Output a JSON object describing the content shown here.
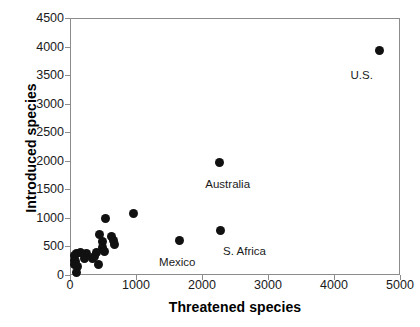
{
  "chart_data": {
    "type": "scatter",
    "title": "",
    "xlabel": "Threatened species",
    "ylabel": "Introduced species",
    "xlim": [
      0,
      5000
    ],
    "ylim": [
      0,
      4500
    ],
    "xticks": [
      0,
      1000,
      2000,
      3000,
      4000,
      5000
    ],
    "yticks": [
      0,
      500,
      1000,
      1500,
      2000,
      2500,
      3000,
      3500,
      4000,
      4500
    ],
    "grid": false,
    "legend": false,
    "marker_color": "#111111",
    "axis_color": "#8c8c8c",
    "points": [
      {
        "x": 4680,
        "y": 3950,
        "label": "U.S."
      },
      {
        "x": 2250,
        "y": 1990,
        "label": "Australia"
      },
      {
        "x": 2270,
        "y": 800,
        "label": "S. Africa"
      },
      {
        "x": 1650,
        "y": 620,
        "label": "Mexico"
      },
      {
        "x": 940,
        "y": 1100,
        "label": ""
      },
      {
        "x": 520,
        "y": 1000,
        "label": ""
      },
      {
        "x": 620,
        "y": 700,
        "label": ""
      },
      {
        "x": 640,
        "y": 620,
        "label": ""
      },
      {
        "x": 660,
        "y": 560,
        "label": ""
      },
      {
        "x": 430,
        "y": 720,
        "label": ""
      },
      {
        "x": 470,
        "y": 600,
        "label": ""
      },
      {
        "x": 480,
        "y": 500,
        "label": ""
      },
      {
        "x": 500,
        "y": 430,
        "label": ""
      },
      {
        "x": 390,
        "y": 420,
        "label": ""
      },
      {
        "x": 360,
        "y": 350,
        "label": ""
      },
      {
        "x": 330,
        "y": 300,
        "label": ""
      },
      {
        "x": 420,
        "y": 210,
        "label": ""
      },
      {
        "x": 240,
        "y": 390,
        "label": ""
      },
      {
        "x": 200,
        "y": 300,
        "label": ""
      },
      {
        "x": 140,
        "y": 420,
        "label": ""
      },
      {
        "x": 90,
        "y": 400,
        "label": ""
      },
      {
        "x": 60,
        "y": 360,
        "label": ""
      },
      {
        "x": 55,
        "y": 280,
        "label": ""
      },
      {
        "x": 70,
        "y": 250,
        "label": ""
      },
      {
        "x": 50,
        "y": 200,
        "label": ""
      },
      {
        "x": 95,
        "y": 160,
        "label": ""
      },
      {
        "x": 85,
        "y": 60,
        "label": ""
      }
    ],
    "annotations": [
      {
        "text": "U.S.",
        "x": 4250,
        "y": 3600
      },
      {
        "text": "Australia",
        "x": 2050,
        "y": 1690
      },
      {
        "text": "S. Africa",
        "x": 2320,
        "y": 520
      },
      {
        "text": "Mexico",
        "x": 1350,
        "y": 330
      }
    ]
  }
}
